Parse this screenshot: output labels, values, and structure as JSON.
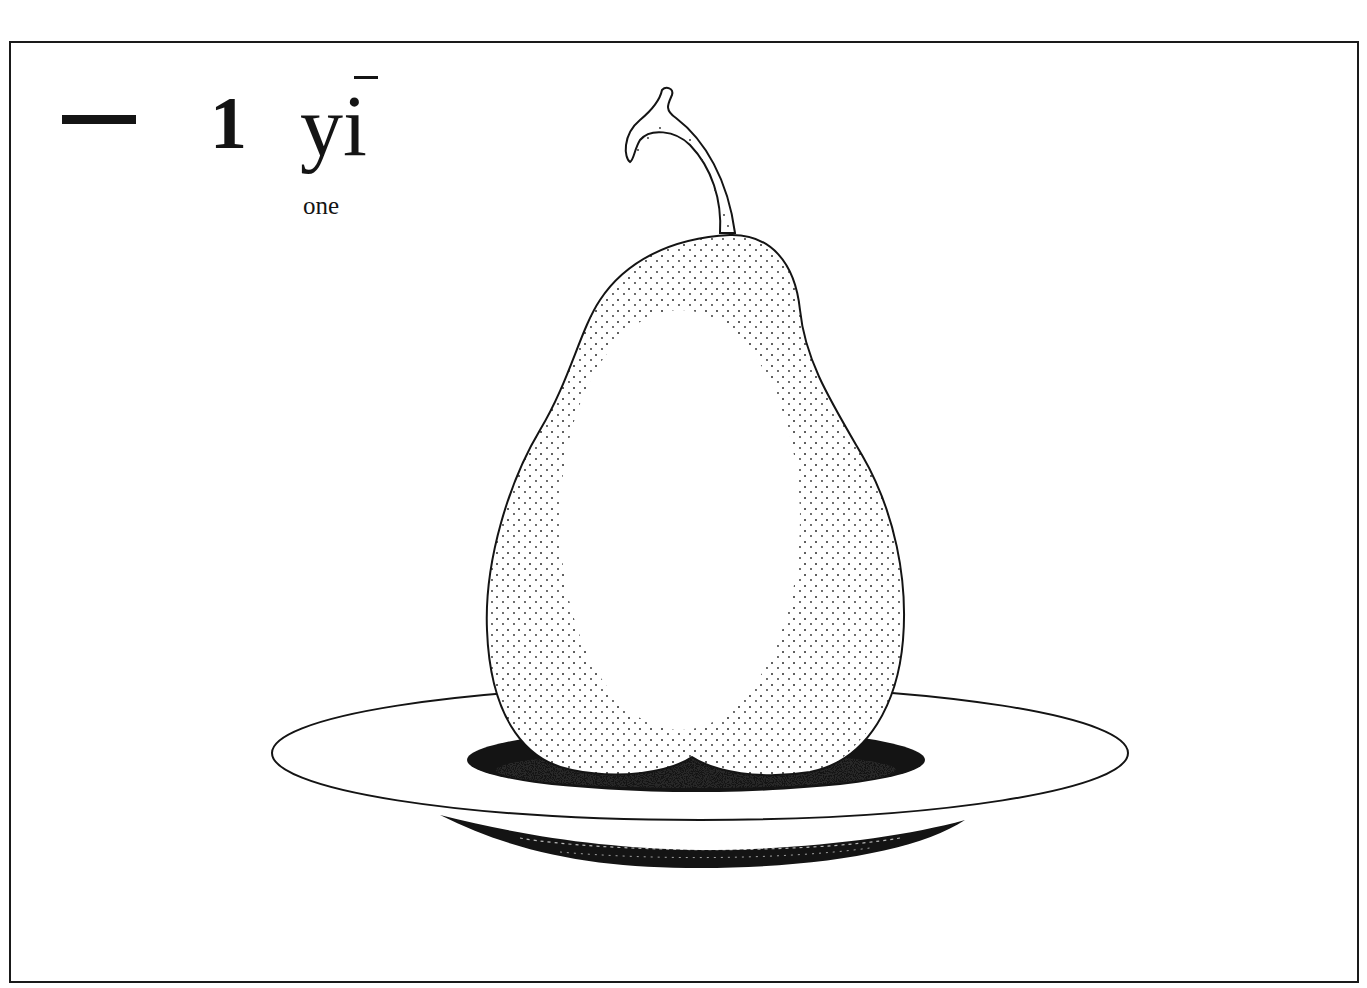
{
  "card": {
    "hanzi": "一",
    "numeral": "1",
    "pinyin": "yi",
    "pinyin_tone": "first tone (macron)",
    "gloss": "one"
  },
  "illustration": {
    "subject": "pear-on-plate",
    "count": 1,
    "colors": {
      "ink": "#141414",
      "paper": "#ffffff"
    }
  }
}
